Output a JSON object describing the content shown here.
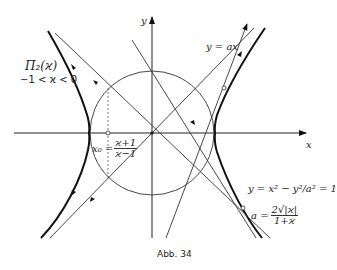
{
  "figure": {
    "caption": "Abb. 34",
    "axes": {
      "x_label": "x",
      "y_label": "y"
    },
    "labels": {
      "curve_name": "Π₂(ϰ)",
      "curve_range": "−1 < ϰ < 0",
      "line_label": "y = ax",
      "x0_lhs": "x₀ =",
      "x0_num": "ϰ+1",
      "x0_den": "ϰ−1",
      "eq_hyperbola": "y = x² − y²/a² = 1",
      "eq_a_lhs": "a =",
      "eq_a_num": "2√|ϰ|",
      "eq_a_den": "1+ϰ"
    },
    "elements": [
      "hyperbola-left-branch",
      "hyperbola-right-branch",
      "unit-circle",
      "x-axis",
      "y-axis",
      "line-y-equals-ax",
      "trajectory-lines"
    ]
  }
}
